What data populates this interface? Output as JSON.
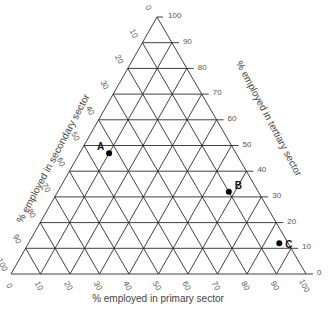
{
  "diagram": {
    "type": "ternary",
    "colors": {
      "grid": "#2a2a2a",
      "labels": "#555555",
      "points": "#000000"
    },
    "axes": {
      "primary": {
        "title": "% employed in primary sector",
        "ticks": [
          "0",
          "10",
          "20",
          "30",
          "40",
          "50",
          "60",
          "70",
          "80",
          "90",
          "100"
        ]
      },
      "secondary": {
        "title": "% employed in secondary sector",
        "ticks": [
          "0",
          "10",
          "20",
          "30",
          "40",
          "50",
          "60",
          "70",
          "80",
          "90",
          "100"
        ]
      },
      "tertiary": {
        "title": "% employed in tertiary sector",
        "ticks": [
          "100",
          "90",
          "80",
          "70",
          "60",
          "50",
          "40",
          "30",
          "20",
          "10",
          "0"
        ]
      }
    },
    "points": [
      {
        "label": "A",
        "primary": 10,
        "secondary": 43,
        "tertiary": 47
      },
      {
        "label": "B",
        "primary": 58,
        "secondary": 10,
        "tertiary": 32
      },
      {
        "label": "C",
        "primary": 85,
        "secondary": 3,
        "tertiary": 12
      }
    ]
  }
}
